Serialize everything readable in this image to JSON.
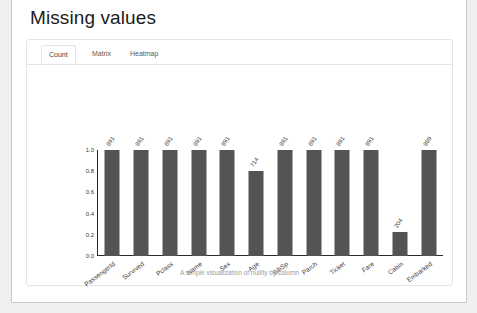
{
  "page": {
    "title": "Missing values"
  },
  "card": {
    "tabs": [
      {
        "label": "Count",
        "active": true
      },
      {
        "label": "Matrix",
        "active": false
      },
      {
        "label": "Heatmap",
        "active": false
      }
    ],
    "caption": "A simple visualization of nullity by column"
  },
  "colors": {
    "bar": "#545454",
    "axis": "#2b2b2b",
    "page_background": "#f0f0f0",
    "sheet_background": "#ffffff",
    "card_border": "#e4e4e4",
    "caption_text": "#9a9a9a"
  },
  "chart_data": {
    "type": "bar",
    "title": "",
    "xlabel": "",
    "ylabel": "",
    "ylim": [
      0.0,
      1.0
    ],
    "grid": false,
    "legend": null,
    "ytick_labels": [
      "1.0",
      "0.8",
      "0.6",
      "0.4",
      "0.2",
      "0.0"
    ],
    "ytick_values": [
      1.0,
      0.8,
      0.6,
      0.4,
      0.2,
      0.0
    ],
    "categories": [
      "PassengerId",
      "Survived",
      "Pclass",
      "Name",
      "Sex",
      "Age",
      "SibSp",
      "Parch",
      "Ticket",
      "Fare",
      "Cabin",
      "Embarked"
    ],
    "values": [
      1.0,
      1.0,
      1.0,
      1.0,
      1.0,
      0.802,
      1.0,
      1.0,
      1.0,
      1.0,
      0.229,
      0.998
    ],
    "data_labels": [
      "891",
      "891",
      "891",
      "891",
      "891",
      "714",
      "891",
      "891",
      "891",
      "891",
      "204",
      "889"
    ],
    "total_rows": 891
  }
}
